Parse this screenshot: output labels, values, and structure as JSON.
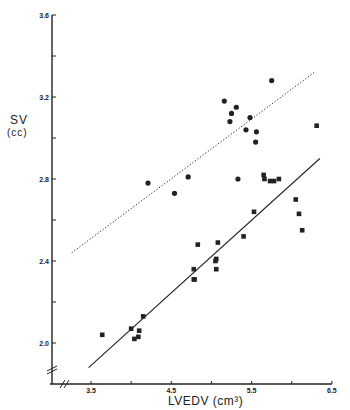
{
  "chart_data": {
    "type": "scatter",
    "title": "",
    "xlabel": "LVEDV (cm³)",
    "ylabel": "SV",
    "ylabel_unit": "(cc)",
    "xlim": [
      3.0,
      6.5
    ],
    "ylim": [
      2.0,
      3.6
    ],
    "x_ticks": [
      3.5,
      4.0,
      4.5,
      5.0,
      5.5,
      6.0,
      6.5
    ],
    "x_tick_labels": [
      "3.5",
      "",
      "4.5",
      "",
      "5.5",
      "",
      "6.5"
    ],
    "y_ticks": [
      2.0,
      2.2,
      2.4,
      2.6,
      2.8,
      3.0,
      3.2,
      3.4,
      3.6
    ],
    "y_tick_labels": [
      "2.0",
      "",
      "2.4",
      "",
      "2.8",
      "",
      "3.2",
      "",
      "3.6"
    ],
    "axis_breaks": [
      "x",
      "y"
    ],
    "grid": false,
    "legend": null,
    "series": [
      {
        "name": "squares",
        "marker": "square",
        "points": [
          [
            3.64,
            2.04
          ],
          [
            4.0,
            2.07
          ],
          [
            4.04,
            2.02
          ],
          [
            4.09,
            2.03
          ],
          [
            4.1,
            2.06
          ],
          [
            4.15,
            2.13
          ],
          [
            4.78,
            2.31
          ],
          [
            4.79,
            2.31
          ],
          [
            4.78,
            2.36
          ],
          [
            4.83,
            2.48
          ],
          [
            5.05,
            2.4
          ],
          [
            5.06,
            2.41
          ],
          [
            5.06,
            2.36
          ],
          [
            5.08,
            2.49
          ],
          [
            5.4,
            2.52
          ],
          [
            5.53,
            2.64
          ],
          [
            5.65,
            2.82
          ],
          [
            5.66,
            2.8
          ],
          [
            5.73,
            2.79
          ],
          [
            5.78,
            2.79
          ],
          [
            5.84,
            2.8
          ],
          [
            6.05,
            2.7
          ],
          [
            6.09,
            2.63
          ],
          [
            6.13,
            2.55
          ],
          [
            6.31,
            3.06
          ]
        ],
        "fit_line": {
          "style": "solid",
          "from": [
            3.47,
            1.88
          ],
          "to": [
            6.35,
            2.9
          ]
        }
      },
      {
        "name": "circles",
        "marker": "circle",
        "points": [
          [
            4.21,
            2.78
          ],
          [
            4.54,
            2.73
          ],
          [
            4.71,
            2.81
          ],
          [
            5.33,
            2.8
          ],
          [
            5.16,
            3.18
          ],
          [
            5.31,
            3.15
          ],
          [
            5.25,
            3.12
          ],
          [
            5.23,
            3.08
          ],
          [
            5.48,
            3.1
          ],
          [
            5.43,
            3.04
          ],
          [
            5.56,
            3.03
          ],
          [
            5.55,
            2.98
          ],
          [
            5.75,
            3.28
          ]
        ],
        "fit_line": {
          "style": "dotted",
          "from": [
            3.26,
            2.44
          ],
          "to": [
            6.28,
            3.32
          ]
        }
      }
    ]
  },
  "labels": {
    "ylabel_main": "SV",
    "ylabel_unit": "(cc)",
    "xlabel": "LVEDV (cm³)"
  },
  "colors": {
    "ink": "#222222",
    "background": "#ffffff"
  }
}
